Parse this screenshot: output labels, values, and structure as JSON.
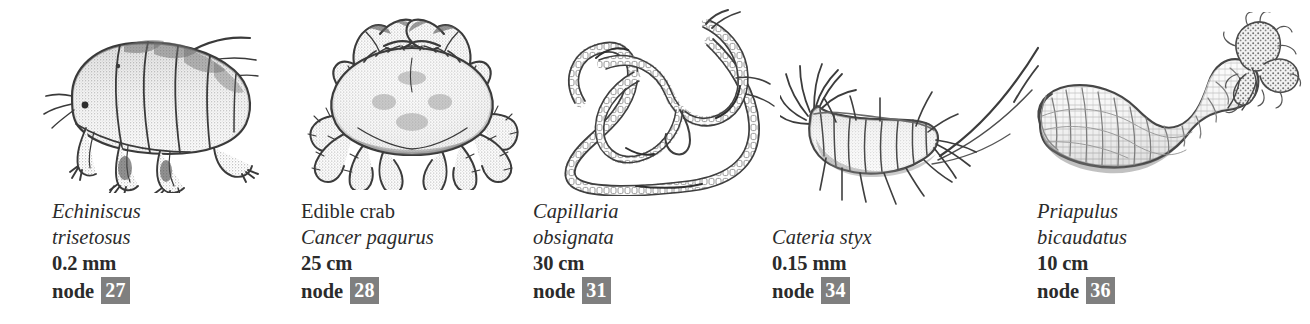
{
  "page": {
    "background_color": "#ffffff",
    "text_color": "#2b2b2b",
    "badge_color": "#7f7f7f",
    "badge_text_color": "#ffffff",
    "panel_count": 5
  },
  "specimens": [
    {
      "illustration": "tardigrade-illustration",
      "common_name": "",
      "scientific_name_line1": "Echiniscus",
      "scientific_name_line2": "trisetosus",
      "size": "0.2 mm",
      "node_label": "node",
      "node_number": "27"
    },
    {
      "illustration": "crab-illustration",
      "common_name": "Edible crab",
      "scientific_name_line1": "Cancer pagurus",
      "scientific_name_line2": "",
      "size": "25 cm",
      "node_label": "node",
      "node_number": "28"
    },
    {
      "illustration": "nematode-illustration",
      "common_name": "",
      "scientific_name_line1": "Capillaria",
      "scientific_name_line2": "obsignata",
      "size": "30 cm",
      "node_label": "node",
      "node_number": "31"
    },
    {
      "illustration": "kinorhynch-illustration",
      "common_name": "",
      "scientific_name_line1": "Cateria styx",
      "scientific_name_line2": "",
      "size": "0.15 mm",
      "node_label": "node",
      "node_number": "34"
    },
    {
      "illustration": "priapulid-illustration",
      "common_name": "",
      "scientific_name_line1": "Priapulus",
      "scientific_name_line2": "bicaudatus",
      "size": "10 cm",
      "node_label": "node",
      "node_number": "36"
    }
  ]
}
